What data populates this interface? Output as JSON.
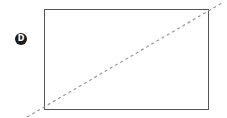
{
  "label": "D",
  "colors": {
    "rect": "#555555",
    "dash": "#999999",
    "badge": "#1a1a1a"
  },
  "rect": {
    "x": 44,
    "y": 9,
    "width": 164,
    "height": 100
  },
  "diagonal": {
    "x1": 27,
    "y1": 117,
    "x2": 222,
    "y2": 3
  }
}
